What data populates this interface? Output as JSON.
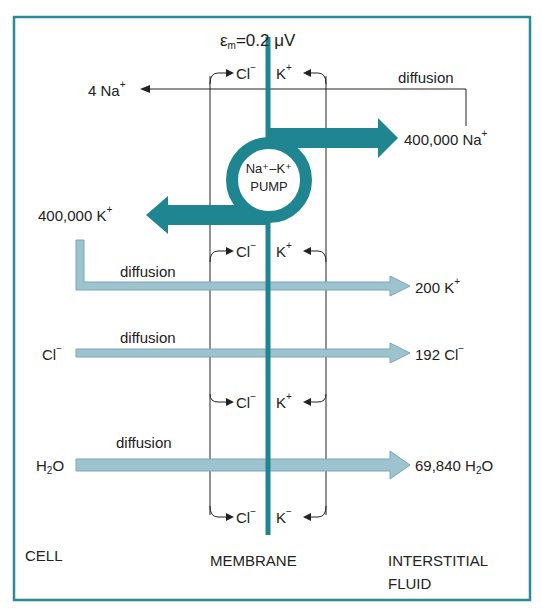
{
  "colors": {
    "frame": "#2a8a95",
    "membrane": "#1f8590",
    "pump_arrow": "#1f8590",
    "diffusion_arrow": "#9dc3cf",
    "diffusion_arrow_border": "#7aa7b4",
    "line": "#222222"
  },
  "potential": {
    "symbol": "ε",
    "subscript": "m",
    "value": "=0.2 μV"
  },
  "brackets": [
    {
      "cl": "Cl",
      "cl_charge": "−",
      "k": "K",
      "k_charge": "+"
    },
    {
      "cl": "Cl",
      "cl_charge": "−",
      "k": "K",
      "k_charge": "+"
    },
    {
      "cl": "Cl",
      "cl_charge": "−",
      "k": "K",
      "k_charge": "+"
    },
    {
      "cl": "Cl",
      "cl_charge": "−",
      "k": "K",
      "k_charge": "−"
    }
  ],
  "na_diffusion": {
    "left": "4 Na",
    "left_charge": "+",
    "label": "diffusion"
  },
  "pump": {
    "line1": "Na⁺–K⁺",
    "line2": "PUMP",
    "out": "400,000 Na",
    "out_charge": "+",
    "in": "400,000 K",
    "in_charge": "+"
  },
  "flows": [
    {
      "label": "diffusion",
      "left": "",
      "right": "200 K",
      "right_charge": "+"
    },
    {
      "label": "diffusion",
      "left": "Cl",
      "left_charge": "−",
      "right": "192 Cl",
      "right_charge": "−"
    },
    {
      "label": "diffusion",
      "left": "H",
      "left_sub": "2",
      "left_tail": "O",
      "right": "69,840 H",
      "right_sub": "2",
      "right_tail": "O"
    }
  ],
  "regions": {
    "cell": "CELL",
    "membrane": "MEMBRANE",
    "fluid_line1": "INTERSTITIAL",
    "fluid_line2": "FLUID"
  }
}
